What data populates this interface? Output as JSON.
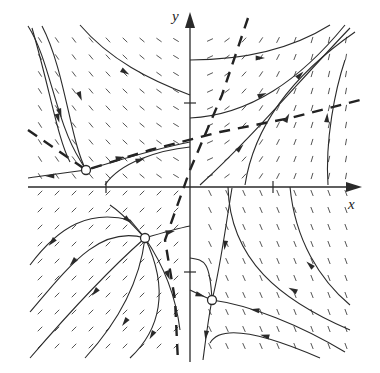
{
  "diagram": {
    "type": "phase-portrait",
    "axes": {
      "x_label": "x",
      "y_label": "y",
      "origin_px": [
        190,
        187
      ],
      "x_axis_px": [
        28,
        360
      ],
      "y_axis_px": [
        362,
        12
      ],
      "tick_marks": [
        {
          "axis": "x",
          "label": "1",
          "px": [
            273,
            187
          ]
        },
        {
          "axis": "x",
          "label": "-1",
          "px": [
            106,
            187
          ]
        },
        {
          "axis": "y",
          "label": "1",
          "px": [
            190,
            103
          ]
        },
        {
          "axis": "y",
          "label": "-1",
          "px": [
            190,
            272
          ]
        }
      ]
    },
    "colors": {
      "background": "#ffffff",
      "ink": "#2a2a2a",
      "field": "#555555",
      "nullcline": "#222222"
    },
    "equilibria": [
      {
        "name": "equilibrium-1",
        "px": [
          86,
          170
        ],
        "style": "open-circle"
      },
      {
        "name": "equilibrium-2",
        "px": [
          145,
          238
        ],
        "style": "open-circle"
      },
      {
        "name": "equilibrium-3",
        "px": [
          212,
          300
        ],
        "style": "open-circle"
      }
    ],
    "nullclines": [
      {
        "name": "nullcline-steep",
        "points": [
          [
            248,
            18
          ],
          [
            222,
            95
          ],
          [
            190,
            170
          ],
          [
            165,
            240
          ],
          [
            175,
            300
          ],
          [
            178,
            362
          ]
        ]
      },
      {
        "name": "nullcline-shallow",
        "points": [
          [
            28,
            130
          ],
          [
            86,
            170
          ],
          [
            150,
            150
          ],
          [
            220,
            132
          ],
          [
            290,
            118
          ],
          [
            360,
            100
          ]
        ]
      }
    ],
    "trajectories": [
      {
        "name": "traj-ul-1",
        "d": "M80,25 C110,60 150,80 190,95",
        "arrows": [
          [
            125,
            72,
            0.55
          ]
        ]
      },
      {
        "name": "traj-ul-2",
        "d": "M28,26 C50,60 55,120 80,160 L86,170",
        "arrows": [
          [
            60,
            113,
            1.25
          ]
        ]
      },
      {
        "name": "traj-ul-3",
        "d": "M42,26 C65,70 70,140 86,170",
        "arrows": [
          [
            80,
            96,
            1.2
          ]
        ]
      },
      {
        "name": "traj-ul-4",
        "d": "M32,28 C50,90 58,140 70,162",
        "arrows": [
          [
            58,
            118,
            1.3
          ]
        ]
      },
      {
        "name": "traj-sep-left",
        "d": "M28,178 C50,175 70,172 86,170",
        "arrows": [
          [
            50,
            176,
            3.14
          ]
        ]
      },
      {
        "name": "traj-sep-upper",
        "d": "M86,170 C120,160 150,150 190,142",
        "arrows": [
          [
            120,
            158,
            -0.2
          ]
        ]
      },
      {
        "name": "traj-upper-mid",
        "d": "M105,185 C120,162 160,150 190,147",
        "arrows": [
          [
            140,
            160,
            -0.3
          ]
        ]
      },
      {
        "name": "traj-ur-1",
        "d": "M190,60 C240,60 290,50 330,25",
        "arrows": [
          [
            260,
            58,
            0
          ]
        ]
      },
      {
        "name": "traj-ur-2",
        "d": "M190,118 C250,115 300,80 345,25",
        "arrows": [
          [
            262,
            95,
            -0.4
          ]
        ]
      },
      {
        "name": "traj-ur-3",
        "d": "M200,185 C250,140 300,80 350,28",
        "arrows": [
          [
            240,
            148,
            -0.8
          ],
          [
            300,
            75,
            -0.8
          ]
        ]
      },
      {
        "name": "traj-ur-4",
        "d": "M245,185 C255,120 300,70 355,32",
        "arrows": [
          [
            287,
            118,
            -1.1
          ]
        ]
      },
      {
        "name": "traj-ur-5",
        "d": "M328,185 C325,140 335,90 345,60",
        "arrows": [
          [
            327,
            118,
            -1.5
          ]
        ]
      },
      {
        "name": "traj-ll-1",
        "d": "M30,265 C60,225 90,210 130,220 L145,238",
        "arrows": [
          [
            52,
            242,
            2.3
          ]
        ]
      },
      {
        "name": "traj-ll-2",
        "d": "M30,312 C70,265 100,225 145,238",
        "arrows": [
          [
            73,
            262,
            2.3
          ]
        ]
      },
      {
        "name": "traj-ll-3",
        "d": "M30,358 C80,300 120,260 145,238",
        "arrows": [
          [
            95,
            292,
            2.3
          ]
        ]
      },
      {
        "name": "traj-ll-4",
        "d": "M85,358 C120,320 140,280 145,238",
        "arrows": [
          [
            125,
            322,
            2.2
          ]
        ]
      },
      {
        "name": "traj-ll-5",
        "d": "M130,358 C160,330 170,290 145,238",
        "arrows": [
          [
            152,
            335,
            2.1
          ]
        ]
      },
      {
        "name": "traj-sep-lower-left",
        "d": "M145,238 C160,260 175,290 180,330",
        "arrows": [
          [
            168,
            275,
            1.2
          ]
        ]
      },
      {
        "name": "traj-sep-mid",
        "d": "M110,205 C125,215 135,228 145,238",
        "arrows": [
          [
            128,
            220,
            0.7
          ]
        ]
      },
      {
        "name": "traj-sep-to-right",
        "d": "M145,238 C165,232 180,228 190,226",
        "arrows": [
          [
            170,
            232,
            -0.2
          ]
        ]
      },
      {
        "name": "traj-lr-1",
        "d": "M232,188 C225,230 220,270 212,300",
        "arrows": [
          [
            225,
            245,
            1.7
          ]
        ]
      },
      {
        "name": "traj-lr-2",
        "d": "M212,300 C208,320 205,345 203,360",
        "arrows": [
          [
            206,
            335,
            1.7
          ]
        ]
      },
      {
        "name": "traj-lr-3",
        "d": "M212,300 C250,305 300,325 345,352",
        "arrows": [
          [
            255,
            310,
            3.3
          ]
        ]
      },
      {
        "name": "traj-lr-4",
        "d": "M228,187 C230,260 280,300 350,330",
        "arrows": [
          [
            293,
            290,
            3.6
          ]
        ]
      },
      {
        "name": "traj-lr-5",
        "d": "M290,187 C295,240 320,280 350,305",
        "arrows": [
          [
            310,
            265,
            3.9
          ]
        ]
      },
      {
        "name": "traj-lr-6",
        "d": "M210,343 C220,325 260,332 320,358",
        "arrows": [
          [
            265,
            336,
            3.4
          ]
        ]
      },
      {
        "name": "traj-lr-7",
        "d": "M190,258 C205,260 210,262 212,300",
        "arrows": []
      },
      {
        "name": "traj-lr-8",
        "d": "M190,290 C200,295 205,297 212,300",
        "arrows": [
          [
            200,
            295,
            0.3
          ]
        ]
      }
    ],
    "field_grid": {
      "x_start": 40,
      "x_end": 355,
      "y_start": 40,
      "y_end": 355,
      "step": 17
    }
  }
}
